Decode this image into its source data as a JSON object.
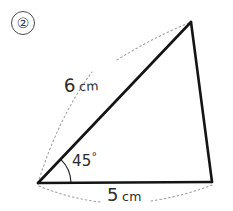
{
  "figure": {
    "item_number": "②",
    "background_color": "#ffffff",
    "stroke_color": "#1a1a1a",
    "dotted_color": "#9a9a9a",
    "text_color": "#2b2b2b"
  },
  "triangle": {
    "vertices": {
      "bottom_left": {
        "x": 38,
        "y": 183
      },
      "apex": {
        "x": 191,
        "y": 22
      },
      "bottom_right": {
        "x": 212,
        "y": 182
      }
    },
    "stroke_width": 2.6
  },
  "labels": {
    "side_six": {
      "value": "6",
      "unit": "cm"
    },
    "base_five": {
      "value": "5",
      "unit": "cm"
    },
    "angle": {
      "value": "45",
      "unit": "°"
    }
  },
  "dimension_arcs": {
    "side_arc": {
      "from": {
        "x": 38,
        "y": 183
      },
      "to": {
        "x": 191,
        "y": 22
      },
      "control": {
        "x": 72,
        "y": 60
      },
      "gap_start": 0.3,
      "gap_end": 0.56
    },
    "base_arc": {
      "from": {
        "x": 38,
        "y": 186
      },
      "to": {
        "x": 212,
        "y": 185
      },
      "control": {
        "x": 125,
        "y": 207
      },
      "gap_start": 0.36,
      "gap_end": 0.62
    }
  },
  "angle_marker": {
    "center": {
      "x": 38,
      "y": 183
    },
    "radius": 33,
    "start_angle_deg": 180,
    "end_angle_deg": 226
  }
}
